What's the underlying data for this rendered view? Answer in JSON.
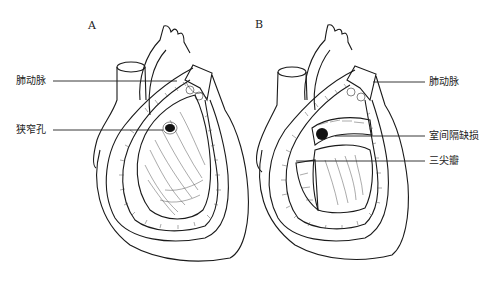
{
  "figure": {
    "panels": [
      {
        "id": "A",
        "label": "A",
        "annotations": [
          {
            "text": "肺动脉",
            "target": "pulmonary-artery"
          },
          {
            "text": "狭窄孔",
            "target": "stenotic-orifice"
          }
        ]
      },
      {
        "id": "B",
        "label": "B",
        "annotations": [
          {
            "text": "肺动脉",
            "target": "pulmonary-artery"
          },
          {
            "text": "室间隔缺损",
            "target": "ventricular-septal-defect"
          },
          {
            "text": "三尖瓣",
            "target": "tricuspid-valve"
          }
        ]
      }
    ],
    "colors": {
      "ink": "#1a1a1a",
      "background": "#ffffff"
    }
  }
}
